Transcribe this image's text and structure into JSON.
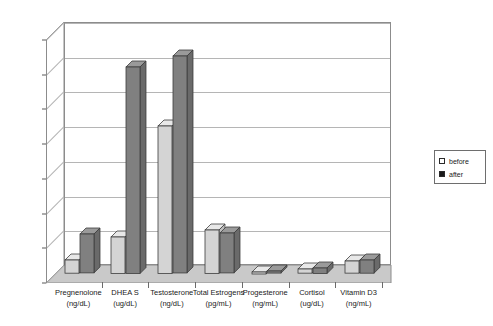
{
  "chart_data": {
    "type": "bar",
    "title": "",
    "subtitle": "",
    "xlabel": "",
    "ylabel": "",
    "ylim": [
      0,
      700
    ],
    "ytick_labels": [
      "0",
      "100",
      "200",
      "300",
      "400",
      "500",
      "600",
      "700"
    ],
    "ytick_values": [
      0,
      100,
      200,
      300,
      400,
      500,
      600,
      700
    ],
    "grid": true,
    "legend_position": "right",
    "style": "3d-clustered-column",
    "categories": [
      "Pregnenolone",
      "DHEA S",
      "Testosterone",
      "Total Estrogens",
      "Progesterone",
      "Cortisol",
      "Vitamin D3"
    ],
    "category_units": [
      "(ng/dL)",
      "(ug/dL)",
      "(ng/dL)",
      "(pg/mL)",
      "(ng/mL)",
      "(ug/dL)",
      "(ng/mL)"
    ],
    "series": [
      {
        "name": "before",
        "color": "#d4d4d4",
        "values": [
          38,
          105,
          425,
          125,
          3,
          12,
          35
        ]
      },
      {
        "name": "after",
        "color": "#808080",
        "values": [
          112,
          595,
          625,
          115,
          6,
          16,
          38
        ]
      }
    ]
  },
  "legend": {
    "items": [
      {
        "label": "before",
        "swatch": "light-square-icon",
        "color": "#ffffff"
      },
      {
        "label": "after",
        "swatch": "dark-square-icon",
        "color": "#1a1a1a"
      }
    ]
  },
  "colors": {
    "before_top": "#e8e8e8",
    "before_front": "#d4d4d4",
    "before_side": "#bdbdbd",
    "after_top": "#9a9a9a",
    "after_front": "#808080",
    "after_side": "#6a6a6a",
    "floor": "#c9c9c9",
    "floor_side": "#b0b0b0",
    "wall": "#ffffff",
    "gridline": "#b5b5b5",
    "axis": "#8c8c8c"
  }
}
